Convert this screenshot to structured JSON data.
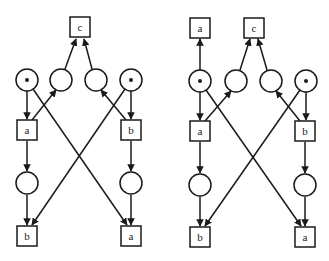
{
  "diagram": {
    "type": "petri-net-pair",
    "stroke_color": "#1a1a1a",
    "background": "#ffffff",
    "nets": [
      {
        "id": "left",
        "transitions": [
          {
            "id": "c_top",
            "label": "c",
            "x": 80,
            "y": 27
          },
          {
            "id": "a_mid",
            "label": "a",
            "x": 26,
            "y": 130
          },
          {
            "id": "b_mid",
            "label": "b",
            "x": 131,
            "y": 130
          },
          {
            "id": "b_bot",
            "label": "b",
            "x": 26,
            "y": 236
          },
          {
            "id": "a_bot",
            "label": "a",
            "x": 131,
            "y": 236
          }
        ],
        "places": [
          {
            "id": "p1",
            "x": 27,
            "y": 80,
            "tokens": 1
          },
          {
            "id": "p2",
            "x": 61,
            "y": 80,
            "tokens": 0
          },
          {
            "id": "p3",
            "x": 96,
            "y": 80,
            "tokens": 0
          },
          {
            "id": "p4",
            "x": 131,
            "y": 80,
            "tokens": 1
          },
          {
            "id": "p5",
            "x": 27,
            "y": 183,
            "tokens": 0
          },
          {
            "id": "p6",
            "x": 131,
            "y": 183,
            "tokens": 0
          }
        ]
      },
      {
        "id": "right",
        "transitions": [
          {
            "id": "a_top",
            "label": "a",
            "x": 200,
            "y": 28
          },
          {
            "id": "c_top",
            "label": "c",
            "x": 254,
            "y": 28
          },
          {
            "id": "a_mid",
            "label": "a",
            "x": 200,
            "y": 131
          },
          {
            "id": "b_mid",
            "label": "b",
            "x": 305,
            "y": 131
          },
          {
            "id": "b_bot",
            "label": "b",
            "x": 200,
            "y": 237
          },
          {
            "id": "a_bot",
            "label": "a",
            "x": 305,
            "y": 237
          }
        ],
        "places": [
          {
            "id": "p1",
            "x": 200,
            "y": 81,
            "tokens": 1
          },
          {
            "id": "p2",
            "x": 236,
            "y": 81,
            "tokens": 0
          },
          {
            "id": "p3",
            "x": 271,
            "y": 81,
            "tokens": 0
          },
          {
            "id": "p4",
            "x": 306,
            "y": 81,
            "tokens": 1
          },
          {
            "id": "p5",
            "x": 200,
            "y": 185,
            "tokens": 0
          },
          {
            "id": "p6",
            "x": 305,
            "y": 185,
            "tokens": 0
          }
        ]
      }
    ]
  },
  "labels": {
    "left_c_top": "c",
    "left_a_mid": "a",
    "left_b_mid": "b",
    "left_b_bot": "b",
    "left_a_bot": "a",
    "right_a_top": "a",
    "right_c_top": "c",
    "right_a_mid": "a",
    "right_b_mid": "b",
    "right_b_bot": "b",
    "right_a_bot": "a"
  }
}
